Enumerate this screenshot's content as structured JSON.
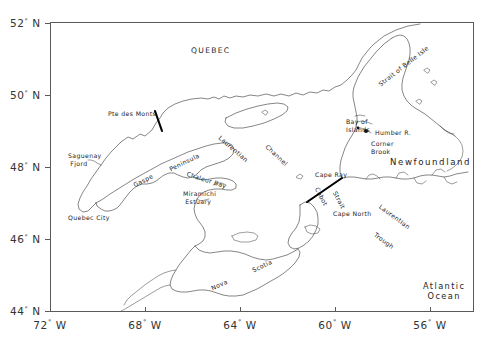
{
  "figure": {
    "type": "map",
    "region": "Gulf of St. Lawrence / Atlantic Canada",
    "projection_note": "rectangular lat-lon grid"
  },
  "axes": {
    "x_label_suffix": "W",
    "y_label_suffix": "N",
    "degree_symbol": "°",
    "x_ticks": [
      {
        "value": 72,
        "text": "72",
        "suffix": "W",
        "px": 50
      },
      {
        "value": 68,
        "text": "68",
        "suffix": "W",
        "px": 145
      },
      {
        "value": 64,
        "text": "64",
        "suffix": "W",
        "px": 240
      },
      {
        "value": 60,
        "text": "60",
        "suffix": "W",
        "px": 335
      },
      {
        "value": 56,
        "text": "56",
        "suffix": "W",
        "px": 430
      }
    ],
    "y_ticks": [
      {
        "value": 52,
        "text": "52",
        "suffix": "N",
        "px": 23
      },
      {
        "value": 50,
        "text": "50",
        "suffix": "N",
        "px": 95
      },
      {
        "value": 48,
        "text": "48",
        "suffix": "N",
        "px": 167
      },
      {
        "value": 46,
        "text": "46",
        "suffix": "N",
        "px": 239
      },
      {
        "value": 44,
        "text": "44",
        "suffix": "N",
        "px": 311
      }
    ],
    "xlim": [
      -73.1,
      -54.2
    ],
    "ylim": [
      43.6,
      52.3
    ],
    "grid": false,
    "frame_color": "#5a5a5a"
  },
  "labels": [
    {
      "id": "quebec",
      "text": "QUEBEC",
      "x": 191,
      "y": 46,
      "rotate": 0,
      "size": "med"
    },
    {
      "id": "pte-des-monts",
      "text": "Pte des Monts",
      "x": 108,
      "y": 110,
      "rotate": 0,
      "size": "sm"
    },
    {
      "id": "saguenay-fjord",
      "text": "Saguenay\n Fjord",
      "x": 68,
      "y": 152,
      "rotate": 0,
      "size": "sm"
    },
    {
      "id": "gaspe",
      "text": "Gaspe",
      "x": 132,
      "y": 182,
      "rotate": -27,
      "size": "sm"
    },
    {
      "id": "peninsula",
      "text": "Peninsula",
      "x": 168,
      "y": 166,
      "rotate": -26,
      "size": "sm"
    },
    {
      "id": "laurentian-channel-1",
      "text": "Laurentian",
      "x": 222,
      "y": 134,
      "rotate": 41,
      "size": "sm"
    },
    {
      "id": "laurentian-channel-2",
      "text": "Channel",
      "x": 269,
      "y": 143,
      "rotate": 43,
      "size": "sm"
    },
    {
      "id": "chaleur-bay",
      "text": "Chaleur Bay",
      "x": 188,
      "y": 170,
      "rotate": 18,
      "size": "sm"
    },
    {
      "id": "miramichi-estuary",
      "text": "Miramichi\n Estuary",
      "x": 183,
      "y": 190,
      "rotate": 0,
      "size": "sm"
    },
    {
      "id": "quebec-city",
      "text": "Quebec City",
      "x": 68,
      "y": 214,
      "rotate": 0,
      "size": "sm"
    },
    {
      "id": "nova",
      "text": "Nova",
      "x": 210,
      "y": 285,
      "rotate": -25,
      "size": "sm"
    },
    {
      "id": "scotia",
      "text": "Scotia",
      "x": 251,
      "y": 267,
      "rotate": -25,
      "size": "sm"
    },
    {
      "id": "cape-ray",
      "text": "Cape Ray",
      "x": 315,
      "y": 171,
      "rotate": 0,
      "size": "sm"
    },
    {
      "id": "cabot",
      "text": "Cabot",
      "x": 320,
      "y": 186,
      "rotate": 62,
      "size": "sm"
    },
    {
      "id": "strait",
      "text": "Strait",
      "x": 338,
      "y": 190,
      "rotate": 62,
      "size": "sm"
    },
    {
      "id": "cape-north",
      "text": "Cape North",
      "x": 333,
      "y": 210,
      "rotate": 0,
      "size": "sm"
    },
    {
      "id": "laurentian-trough-1",
      "text": "Laurentian",
      "x": 382,
      "y": 203,
      "rotate": 36,
      "size": "sm"
    },
    {
      "id": "laurentian-trough-2",
      "text": "Trough",
      "x": 377,
      "y": 231,
      "rotate": 36,
      "size": "sm"
    },
    {
      "id": "strait-of-belle-isle",
      "text": "Strait of Belle Isle",
      "x": 377,
      "y": 82,
      "rotate": -38,
      "size": "sm"
    },
    {
      "id": "bay-of-islands",
      "text": "Bay of\nIslands",
      "x": 346,
      "y": 118,
      "rotate": 0,
      "size": "sm"
    },
    {
      "id": "humber-river",
      "text": "Humber R.",
      "x": 375,
      "y": 129,
      "rotate": 0,
      "size": "sm"
    },
    {
      "id": "corner-brook",
      "text": "Corner\nBrook",
      "x": 371,
      "y": 140,
      "rotate": 0,
      "size": "sm"
    },
    {
      "id": "newfoundland",
      "text": "Newfoundland",
      "x": 390,
      "y": 157,
      "rotate": 0,
      "size": "big"
    },
    {
      "id": "atlantic-ocean",
      "text": "Atlantic\nOcean",
      "x": 423,
      "y": 281,
      "rotate": 0,
      "size": "ocean"
    }
  ],
  "markers": [
    {
      "id": "corner-brook-dot",
      "x": 366,
      "y": 131
    },
    {
      "id": "bay-of-islands-dot",
      "x": 357,
      "y": 128
    }
  ],
  "transects": [
    {
      "id": "pte-des-monts-transect",
      "x1": 155,
      "y1": 111,
      "x2": 162,
      "y2": 131
    },
    {
      "id": "cabot-strait-transect",
      "x1": 307,
      "y1": 202,
      "x2": 342,
      "y2": 178
    }
  ],
  "colors": {
    "background": "#ffffff",
    "coastline": "#3a3a3a",
    "frame": "#5a5a5a",
    "text": "#1d1d1d",
    "transect": "#000000"
  }
}
